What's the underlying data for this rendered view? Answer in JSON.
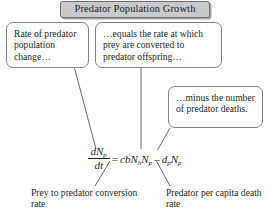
{
  "diagram": {
    "title": "Predator Population Growth",
    "callouts": [
      {
        "id": "rate-of-change",
        "text": "Rate of predator population change…"
      },
      {
        "id": "equals-rate",
        "text": "…equals the rate at which prey are converted to predator offspring…"
      },
      {
        "id": "minus-deaths",
        "text": "…minus the number of predator deaths."
      }
    ],
    "equation": {
      "lhs_numerator_var": "dN",
      "lhs_numerator_sub": "p",
      "lhs_denominator": "dt",
      "equals": "=",
      "term1_coeff": "cb",
      "term1_var1": "N",
      "term1_sub1": "h",
      "term1_var2": "N",
      "term1_sub2": "p",
      "minus": "–",
      "term2_coeff": "d",
      "term2_coeff_sub": "p",
      "term2_var": "N",
      "term2_sub": "p",
      "plain": "dNp/dt = cbNhNp – dpNp"
    },
    "captions": [
      {
        "id": "conversion-rate",
        "text": "Prey to predator conversion rate"
      },
      {
        "id": "death-rate",
        "text": "Predator per capita death rate"
      }
    ],
    "colors": {
      "title_fill": "#c9cacb",
      "title_border": "#6d6e71",
      "callout_border": "#808285",
      "text": "#231f20",
      "background": "#ffffff"
    }
  }
}
